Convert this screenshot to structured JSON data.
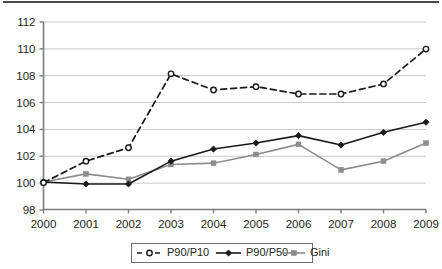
{
  "figure": {
    "top_rule": "horizontal-rule",
    "background_color": "#ffffff"
  },
  "chart_data": {
    "type": "line",
    "title": "",
    "subtitle": "",
    "xlabel": "",
    "ylabel": "",
    "categories": [
      "2000",
      "2001",
      "2002",
      "2003",
      "2004",
      "2005",
      "2006",
      "2007",
      "2008",
      "2009"
    ],
    "x": [
      2000,
      2001,
      2002,
      2003,
      2004,
      2005,
      2006,
      2007,
      2008,
      2009
    ],
    "ylim": [
      98,
      112
    ],
    "yticks": [
      "98",
      "100",
      "102",
      "104",
      "106",
      "108",
      "110",
      "112"
    ],
    "ytick_values": [
      98,
      100,
      102,
      104,
      106,
      108,
      110,
      112
    ],
    "grid": true,
    "grid_axis": "y",
    "legend_position": "bottom-center",
    "series": [
      {
        "name": "P90/P10",
        "values": [
          100.0,
          101.6,
          102.6,
          108.1,
          106.9,
          107.15,
          106.6,
          106.6,
          107.35,
          109.95
        ],
        "color": "#1a1a1a",
        "line_style": "dashed",
        "marker": "open-circle"
      },
      {
        "name": "P90/P50",
        "values": [
          100.05,
          99.9,
          99.9,
          101.6,
          102.5,
          102.95,
          103.5,
          102.8,
          103.75,
          104.5
        ],
        "color": "#1a1a1a",
        "line_style": "solid",
        "marker": "filled-diamond"
      },
      {
        "name": "Gini",
        "values": [
          100.05,
          100.65,
          100.25,
          101.35,
          101.45,
          102.1,
          102.85,
          100.95,
          101.6,
          102.95
        ],
        "color": "#8c8c8c",
        "line_style": "solid",
        "marker": "filled-square"
      }
    ]
  },
  "legend": {
    "entries": [
      {
        "label": "P90/P10"
      },
      {
        "label": "P90/P50"
      },
      {
        "label": "Gini"
      }
    ]
  },
  "colors": {
    "axis": "#7d7d7d",
    "grid": "#c9c9c9",
    "text": "#231f20",
    "series_dark": "#1a1a1a",
    "series_gray": "#8c8c8c",
    "top_rule": "#4a4a4a"
  }
}
